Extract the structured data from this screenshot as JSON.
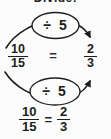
{
  "title": "Divide!",
  "colors": {
    "background": "#fcfcfc",
    "ink": "#1d1d1d"
  },
  "diagram": {
    "top_operation": "÷ 5",
    "bottom_operation": "÷ 5",
    "left_fraction": {
      "numerator": "10",
      "denominator": "15"
    },
    "equals": "=",
    "right_fraction": {
      "numerator": "2",
      "denominator": "3"
    }
  },
  "result_equation": {
    "left_fraction": {
      "numerator": "10",
      "denominator": "15"
    },
    "equals": "=",
    "right_fraction": {
      "numerator": "2",
      "denominator": "3"
    }
  }
}
